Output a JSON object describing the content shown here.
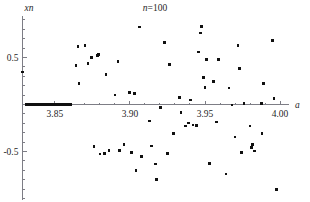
{
  "chart_data": {
    "type": "scatter",
    "title": "n=100",
    "title_prefix_italic": "n",
    "title_suffix": "=100",
    "xlabel": "a",
    "ylabel": "xn",
    "xlim": [
      3.8284,
      4.0053
    ],
    "ylim": [
      -1.02,
      0.92
    ],
    "xticks": [
      3.85,
      3.9,
      3.95,
      4.0
    ],
    "xtick_labels": [
      "3.85",
      "3.90",
      "3.95",
      "4.00"
    ],
    "xticks_minor": [
      3.86,
      3.87,
      3.88,
      3.89,
      3.91,
      3.92,
      3.93,
      3.94,
      3.96,
      3.97,
      3.98,
      3.99
    ],
    "yticks": [
      0.5,
      -0.5
    ],
    "ytick_labels": [
      "0.5",
      "-0.5"
    ],
    "yticks_minor": [
      0.9,
      0.8,
      0.7,
      0.6,
      0.4,
      0.3,
      0.2,
      0.1,
      -0.1,
      -0.2,
      -0.3,
      -0.4,
      -0.6,
      -0.7,
      -0.8,
      -0.9,
      -1.0
    ],
    "grid": false,
    "legend": false,
    "marker": "square",
    "marker_size_px": 2.6,
    "marker_color": "#101010",
    "axis_color": "#7d7d85",
    "background": "#ffffff",
    "series": [
      {
        "name": "xn at n=100",
        "points": [
          [
            3.8284,
            0.345
          ],
          [
            3.831,
            0.0
          ],
          [
            3.833,
            0.0
          ],
          [
            3.835,
            0.0
          ],
          [
            3.837,
            0.0
          ],
          [
            3.839,
            0.0
          ],
          [
            3.841,
            0.0
          ],
          [
            3.843,
            0.0
          ],
          [
            3.845,
            0.0
          ],
          [
            3.847,
            0.0
          ],
          [
            3.849,
            0.0
          ],
          [
            3.851,
            0.0
          ],
          [
            3.853,
            0.0
          ],
          [
            3.855,
            0.0
          ],
          [
            3.857,
            0.0
          ],
          [
            3.859,
            0.0
          ],
          [
            3.8605,
            0.0
          ],
          [
            3.864,
            0.412
          ],
          [
            3.8655,
            0.615
          ],
          [
            3.866,
            0.225
          ],
          [
            3.87,
            0.628
          ],
          [
            3.872,
            0.438
          ],
          [
            3.8745,
            0.497
          ],
          [
            3.876,
            -0.445
          ],
          [
            3.8785,
            0.52
          ],
          [
            3.879,
            0.53
          ],
          [
            3.88,
            -0.525
          ],
          [
            3.883,
            -0.522
          ],
          [
            3.884,
            0.32
          ],
          [
            3.886,
            -0.492
          ],
          [
            3.89,
            0.1
          ],
          [
            3.892,
            0.458
          ],
          [
            3.893,
            -0.488
          ],
          [
            3.896,
            -0.425
          ],
          [
            3.8995,
            0.128
          ],
          [
            3.901,
            -0.51
          ],
          [
            3.903,
            0.118
          ],
          [
            3.904,
            -0.7
          ],
          [
            3.9065,
            0.825
          ],
          [
            3.9075,
            -0.555
          ],
          [
            3.913,
            -0.175
          ],
          [
            3.9145,
            -0.44
          ],
          [
            3.917,
            -0.635
          ],
          [
            3.9175,
            -0.8
          ],
          [
            3.9205,
            -0.035
          ],
          [
            3.923,
            0.66
          ],
          [
            3.925,
            -0.52
          ],
          [
            3.9265,
            0.425
          ],
          [
            3.929,
            -0.31
          ],
          [
            3.933,
            0.075
          ],
          [
            3.934,
            -0.085
          ],
          [
            3.937,
            -0.23
          ],
          [
            3.939,
            -0.195
          ],
          [
            3.9405,
            0.05
          ],
          [
            3.942,
            -0.22
          ],
          [
            3.9445,
            -0.225
          ],
          [
            3.9455,
            0.56
          ],
          [
            3.947,
            0.76
          ],
          [
            3.9475,
            0.83
          ],
          [
            3.949,
            0.285
          ],
          [
            3.95,
            0.18
          ],
          [
            3.951,
            0.48
          ],
          [
            3.953,
            -0.625
          ],
          [
            3.9555,
            0.245
          ],
          [
            3.9575,
            -0.185
          ],
          [
            3.959,
            0.48
          ],
          [
            3.964,
            -0.74
          ],
          [
            3.966,
            0.175
          ],
          [
            3.968,
            -0.005
          ],
          [
            3.97,
            -0.345
          ],
          [
            3.972,
            0.625
          ],
          [
            3.973,
            0.38
          ],
          [
            3.9745,
            -0.51
          ],
          [
            3.976,
            0.01
          ],
          [
            3.98,
            -0.23
          ],
          [
            3.981,
            -0.46
          ],
          [
            3.9815,
            -0.425
          ],
          [
            3.983,
            -0.495
          ],
          [
            3.9875,
            0.01
          ],
          [
            3.988,
            -0.31
          ],
          [
            3.989,
            0.225
          ],
          [
            3.995,
            0.68
          ],
          [
            3.996,
            0.065
          ],
          [
            3.9975,
            -0.905
          ]
        ]
      }
    ],
    "point_count_note": "n=100"
  }
}
